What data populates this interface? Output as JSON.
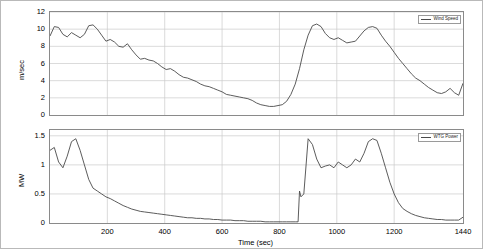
{
  "figure": {
    "xlabel": "Time (sec)",
    "panels": [
      {
        "id": "top",
        "ylabel": "m/sec",
        "legend": "Wind Speed",
        "yticks": [
          "0",
          "2",
          "4",
          "6",
          "8",
          "10",
          "12"
        ],
        "ylim": [
          0,
          12
        ],
        "grid": true
      },
      {
        "id": "bottom",
        "ylabel": "MW",
        "legend": "WTG Power",
        "yticks": [
          "0",
          "0.5",
          "1",
          "1.5"
        ],
        "ylim": [
          0,
          1.6
        ],
        "grid": true
      }
    ],
    "xticks": [
      "200",
      "400",
      "600",
      "800",
      "1000",
      "1200",
      "1440"
    ],
    "xlim": [
      0,
      1440
    ]
  },
  "chart_data": {
    "type": "line",
    "title": "",
    "xlabel": "Time (sec)",
    "xlim": [
      0,
      1440
    ],
    "grid": true,
    "legend_position": "top-right",
    "subplots": [
      {
        "name": "Wind Speed",
        "ylabel": "m/sec",
        "ylim": [
          0,
          12
        ],
        "yticks": [
          0,
          2,
          4,
          6,
          8,
          10,
          12
        ],
        "series": [
          {
            "name": "Wind Speed",
            "color": "#4a4a4a",
            "x": [
              0,
              15,
              30,
              45,
              60,
              75,
              90,
              105,
              120,
              135,
              150,
              165,
              180,
              195,
              210,
              225,
              240,
              255,
              270,
              285,
              300,
              315,
              330,
              345,
              360,
              375,
              390,
              405,
              420,
              435,
              450,
              465,
              480,
              495,
              510,
              525,
              540,
              555,
              570,
              585,
              600,
              615,
              630,
              645,
              660,
              675,
              690,
              705,
              720,
              735,
              750,
              765,
              780,
              795,
              810,
              825,
              840,
              855,
              870,
              885,
              900,
              915,
              930,
              945,
              960,
              975,
              990,
              1005,
              1020,
              1035,
              1050,
              1065,
              1080,
              1095,
              1110,
              1125,
              1140,
              1155,
              1170,
              1185,
              1200,
              1215,
              1230,
              1245,
              1260,
              1275,
              1290,
              1305,
              1320,
              1335,
              1350,
              1365,
              1380,
              1395,
              1410,
              1425,
              1440
            ],
            "y": [
              9.2,
              10.3,
              10.2,
              9.4,
              9.1,
              9.6,
              9.3,
              9.0,
              9.4,
              10.4,
              10.5,
              10.0,
              9.3,
              8.6,
              8.8,
              8.5,
              8.0,
              7.9,
              8.3,
              7.6,
              7.0,
              6.5,
              6.6,
              6.4,
              6.3,
              6.0,
              5.6,
              5.3,
              5.4,
              5.1,
              4.7,
              4.4,
              4.3,
              4.1,
              3.9,
              3.6,
              3.4,
              3.3,
              3.1,
              2.9,
              2.7,
              2.4,
              2.3,
              2.2,
              2.1,
              2.0,
              1.9,
              1.7,
              1.4,
              1.2,
              1.1,
              1.0,
              1.0,
              1.1,
              1.2,
              1.6,
              2.4,
              3.6,
              5.4,
              7.6,
              9.3,
              10.4,
              10.6,
              10.3,
              9.5,
              9.0,
              8.8,
              9.0,
              8.7,
              8.4,
              8.5,
              8.6,
              9.2,
              9.8,
              10.2,
              10.3,
              10.1,
              9.3,
              8.6,
              8.0,
              7.3,
              6.6,
              6.0,
              5.4,
              4.8,
              4.3,
              4.0,
              3.6,
              3.2,
              2.9,
              2.6,
              2.5,
              2.7,
              3.1,
              2.6,
              2.3,
              3.7
            ]
          }
        ]
      },
      {
        "name": "WTG Power",
        "ylabel": "MW",
        "ylim": [
          0,
          1.6
        ],
        "yticks": [
          0,
          0.5,
          1,
          1.5
        ],
        "series": [
          {
            "name": "WTG Power",
            "color": "#4a4a4a",
            "x": [
              0,
              15,
              30,
              45,
              60,
              75,
              90,
              105,
              120,
              135,
              150,
              165,
              180,
              195,
              210,
              225,
              240,
              255,
              270,
              285,
              300,
              315,
              330,
              345,
              360,
              375,
              390,
              405,
              420,
              435,
              450,
              465,
              480,
              495,
              510,
              525,
              540,
              555,
              570,
              585,
              600,
              615,
              630,
              645,
              660,
              675,
              690,
              705,
              720,
              735,
              750,
              765,
              780,
              795,
              810,
              825,
              840,
              855,
              865,
              870,
              875,
              885,
              900,
              915,
              930,
              945,
              960,
              975,
              990,
              1005,
              1020,
              1035,
              1050,
              1065,
              1080,
              1095,
              1110,
              1125,
              1140,
              1155,
              1170,
              1185,
              1200,
              1215,
              1230,
              1245,
              1260,
              1275,
              1290,
              1305,
              1320,
              1335,
              1350,
              1365,
              1380,
              1395,
              1410,
              1425,
              1440
            ],
            "y": [
              1.25,
              1.3,
              1.05,
              0.95,
              1.15,
              1.4,
              1.45,
              1.25,
              1.0,
              0.75,
              0.6,
              0.55,
              0.5,
              0.45,
              0.42,
              0.38,
              0.34,
              0.3,
              0.27,
              0.24,
              0.22,
              0.2,
              0.19,
              0.18,
              0.17,
              0.16,
              0.15,
              0.14,
              0.13,
              0.12,
              0.11,
              0.1,
              0.09,
              0.09,
              0.08,
              0.08,
              0.07,
              0.07,
              0.06,
              0.06,
              0.05,
              0.05,
              0.05,
              0.04,
              0.04,
              0.04,
              0.03,
              0.03,
              0.03,
              0.03,
              0.02,
              0.02,
              0.02,
              0.02,
              0.02,
              0.02,
              0.02,
              0.02,
              0.02,
              0.55,
              0.45,
              0.5,
              1.45,
              1.35,
              1.1,
              0.95,
              0.98,
              1.0,
              0.95,
              1.05,
              1.0,
              0.95,
              1.0,
              1.1,
              1.05,
              1.2,
              1.4,
              1.45,
              1.42,
              1.2,
              0.95,
              0.7,
              0.5,
              0.35,
              0.25,
              0.2,
              0.16,
              0.13,
              0.11,
              0.09,
              0.08,
              0.07,
              0.06,
              0.06,
              0.05,
              0.05,
              0.05,
              0.05,
              0.1
            ]
          }
        ]
      }
    ]
  }
}
